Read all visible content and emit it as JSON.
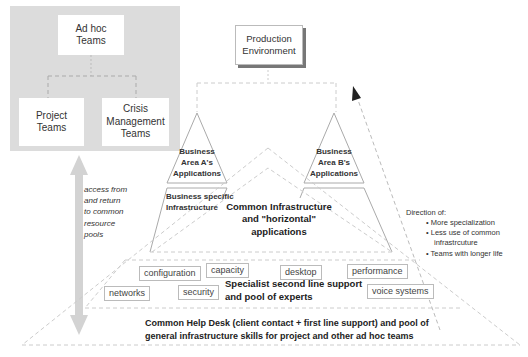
{
  "left_panel": {
    "adhoc_box": "Ad hoc\nTeams",
    "project_box": "Project\nTeams",
    "crisis_box": "Crisis\nManagement\nTeams",
    "access_note": [
      "access from",
      "and return",
      "to common",
      "resource",
      "pools"
    ]
  },
  "production_box": "Production\nEnvironment",
  "business_areas": {
    "a": [
      "Business",
      "Area A's",
      "Applications"
    ],
    "b": [
      "Business",
      "Area B's",
      "Applications"
    ],
    "specific_infra": [
      "Business specific",
      "Infrastructure"
    ]
  },
  "common_infra": [
    "Common Infrastructure",
    "and \"horizontal\"",
    "applications"
  ],
  "specialist_boxes": {
    "row1": [
      "configuration",
      "capacity",
      "desktop",
      "performance"
    ],
    "row2": [
      "networks",
      "security",
      "voice systems"
    ]
  },
  "specialist_label": [
    "Specialist second line support",
    "and pool of experts"
  ],
  "helpdesk_label": [
    "Common Help Desk (client contact + first line support) and pool of",
    "general infrastructure skills for project and other ad hoc teams"
  ],
  "direction": {
    "title": "Direction of:",
    "items": [
      "More specialization",
      "Less use of common",
      "infrastrcuture",
      "Teams with longer life"
    ]
  },
  "colors": {
    "panel_gray": "#dcdcdc",
    "arrow_gray": "#d3d3d3",
    "dash_gray": "#c8c8c8",
    "line_gray": "#aaaaaa"
  }
}
